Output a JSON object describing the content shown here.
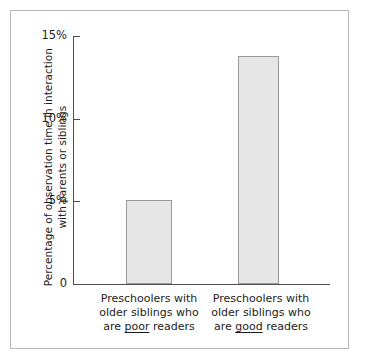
{
  "chart_data": {
    "type": "bar",
    "title": "",
    "xlabel": "",
    "ylabel": "Percentage of observation time in interaction with parents or siblings",
    "ylabel_lines": [
      "Percentage of observation time in interaction",
      "with parents or siblings"
    ],
    "categories": [
      "Preschoolers with older siblings who are poor readers",
      "Preschoolers with older siblings who are good readers"
    ],
    "category_lines": [
      [
        "Preschoolers with",
        "older siblings who",
        "are ",
        "poor",
        " readers"
      ],
      [
        "Preschoolers with",
        "older siblings who",
        "are ",
        "good",
        " readers"
      ]
    ],
    "values": [
      5.1,
      13.8
    ],
    "ylim": [
      0,
      15
    ],
    "yticks": [
      0,
      5,
      10,
      15
    ],
    "ytick_labels": [
      "0",
      "5%",
      "10%",
      "15%"
    ],
    "grid": false,
    "legend": false,
    "bar_color": "#e6e6e6",
    "bar_border_color": "#9a9a9a",
    "axis_color": "#4d4d4d",
    "frame_color": "#b6b6b6",
    "background": "#ffffff"
  },
  "axis": {
    "tick_0": "0",
    "tick_1": "5%",
    "tick_2": "10%",
    "tick_3": "15%"
  },
  "categories": {
    "left": {
      "line1": "Preschoolers with",
      "line2": "older siblings who",
      "line3_pre": "are ",
      "line3_emph": "poor",
      "line3_post": " readers"
    },
    "right": {
      "line1": "Preschoolers with",
      "line2": "older siblings who",
      "line3_pre": "are ",
      "line3_emph": "good",
      "line3_post": " readers"
    }
  },
  "ytitle": {
    "line1": "Percentage of observation time in interaction",
    "line2": "with parents or siblings"
  }
}
